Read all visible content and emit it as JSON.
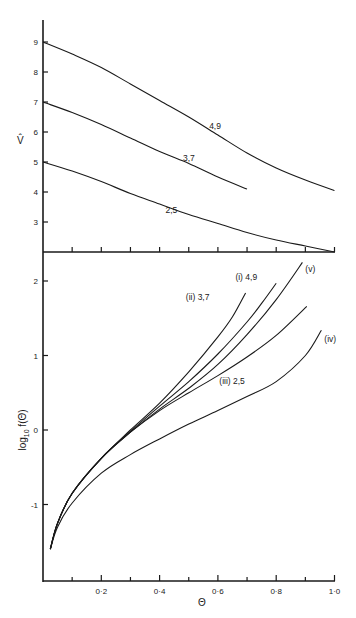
{
  "chart_data": [
    {
      "type": "line",
      "title": "",
      "xlabel": "",
      "ylabel": "V̂",
      "xlim": [
        0,
        1.0
      ],
      "ylim": [
        2,
        10
      ],
      "yticks": [
        3,
        4,
        5,
        6,
        7,
        8,
        9
      ],
      "ytick_labels": [
        "3",
        "4",
        "5",
        "6",
        "7",
        "8",
        "9"
      ],
      "xticks": [
        0.1,
        0.2,
        0.3,
        0.4,
        0.5,
        0.6,
        0.7,
        0.8,
        0.9,
        1.0
      ],
      "grid": false,
      "legend": "inline labels",
      "series": [
        {
          "name": "4,9",
          "x": [
            0.0,
            0.1,
            0.2,
            0.3,
            0.4,
            0.5,
            0.6,
            0.7,
            0.8,
            0.9,
            1.0
          ],
          "y": [
            9.0,
            8.6,
            8.15,
            7.6,
            7.05,
            6.5,
            5.9,
            5.3,
            4.8,
            4.4,
            4.05
          ],
          "label_pos": [
            0.57,
            6.1
          ]
        },
        {
          "name": "3,7",
          "x": [
            0.0,
            0.1,
            0.2,
            0.3,
            0.4,
            0.5,
            0.6,
            0.7
          ],
          "y": [
            7.0,
            6.65,
            6.25,
            5.8,
            5.35,
            4.95,
            4.5,
            4.1
          ],
          "label_pos": [
            0.48,
            5.05
          ]
        },
        {
          "name": "2,5",
          "x": [
            0.0,
            0.1,
            0.2,
            0.3,
            0.4,
            0.5,
            0.6,
            0.7,
            0.8,
            0.9,
            1.0
          ],
          "y": [
            5.0,
            4.7,
            4.35,
            3.95,
            3.6,
            3.25,
            2.95,
            2.65,
            2.4,
            2.2,
            2.0
          ],
          "label_pos": [
            0.42,
            3.3
          ]
        }
      ]
    },
    {
      "type": "line",
      "title": "",
      "xlabel": "Θ",
      "ylabel": "log10 f(Θ)",
      "ylabel_main": "log",
      "ylabel_sub": "10",
      "ylabel_rest": " f(Θ)",
      "xlim": [
        0,
        1.0
      ],
      "ylim": [
        -2,
        2.4
      ],
      "yticks": [
        -1,
        0,
        1,
        2
      ],
      "ytick_labels": [
        "-1",
        "0",
        "1",
        "2"
      ],
      "xticks": [
        0.1,
        0.2,
        0.3,
        0.4,
        0.5,
        0.6,
        0.7,
        0.8,
        0.9,
        1.0
      ],
      "xtick_labels": [
        "",
        "0·2",
        "",
        "0·4",
        "",
        "0·6",
        "",
        "0·8",
        "",
        "1·0"
      ],
      "grid": false,
      "legend": "inline labels",
      "series": [
        {
          "name": "(i) 4,9",
          "x": [
            0.025,
            0.05,
            0.1,
            0.2,
            0.3,
            0.4,
            0.5,
            0.6,
            0.7,
            0.75,
            0.8
          ],
          "y": [
            -1.6,
            -1.25,
            -0.85,
            -0.38,
            -0.02,
            0.32,
            0.65,
            1.02,
            1.45,
            1.7,
            1.97
          ],
          "label_pos": [
            0.66,
            2.02
          ]
        },
        {
          "name": "(ii) 3,7",
          "x": [
            0.025,
            0.05,
            0.1,
            0.2,
            0.3,
            0.4,
            0.5,
            0.6,
            0.65,
            0.695
          ],
          "y": [
            -1.6,
            -1.25,
            -0.85,
            -0.38,
            0.0,
            0.36,
            0.78,
            1.25,
            1.52,
            1.84
          ],
          "label_pos": [
            0.49,
            1.74
          ]
        },
        {
          "name": "(iii) 2,5",
          "x": [
            0.025,
            0.05,
            0.1,
            0.2,
            0.3,
            0.4,
            0.5,
            0.6,
            0.7,
            0.8,
            0.905
          ],
          "y": [
            -1.6,
            -1.25,
            -0.85,
            -0.38,
            -0.03,
            0.26,
            0.5,
            0.73,
            0.98,
            1.27,
            1.66
          ],
          "label_pos": [
            0.605,
            0.62
          ]
        },
        {
          "name": "(iv)",
          "x": [
            0.025,
            0.05,
            0.1,
            0.2,
            0.3,
            0.4,
            0.5,
            0.6,
            0.7,
            0.8,
            0.9,
            0.955
          ],
          "y": [
            -1.6,
            -1.3,
            -0.98,
            -0.58,
            -0.33,
            -0.12,
            0.08,
            0.26,
            0.45,
            0.65,
            1.0,
            1.34
          ],
          "label_pos": [
            0.965,
            1.18
          ]
        },
        {
          "name": "(v)",
          "x": [
            0.025,
            0.05,
            0.1,
            0.2,
            0.3,
            0.4,
            0.5,
            0.6,
            0.7,
            0.8,
            0.89
          ],
          "y": [
            -1.6,
            -1.25,
            -0.85,
            -0.38,
            -0.03,
            0.28,
            0.56,
            0.88,
            1.28,
            1.75,
            2.25
          ],
          "label_pos": [
            0.9,
            2.12
          ]
        }
      ]
    }
  ]
}
